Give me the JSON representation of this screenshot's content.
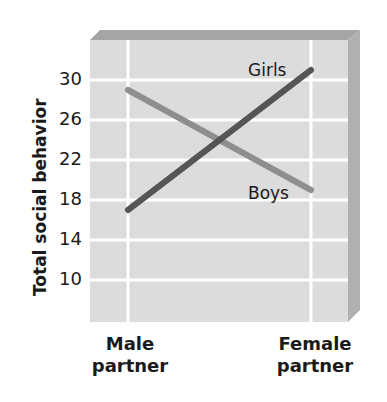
{
  "chart_data": {
    "type": "line",
    "title": "",
    "xlabel": "",
    "ylabel": "Total social behavior",
    "categories": [
      "Male partner",
      "Female partner"
    ],
    "x_tick_lines": [
      [
        "Male",
        "partner"
      ],
      [
        "Female",
        "partner"
      ]
    ],
    "y_ticks": [
      10,
      14,
      18,
      22,
      26,
      30
    ],
    "y_tick_labels": [
      "10",
      "14",
      "18",
      "22",
      "26",
      "30"
    ],
    "ylim": [
      6,
      34
    ],
    "grid": true,
    "legend": "inline labels",
    "series": [
      {
        "name": "Girls",
        "values": [
          17,
          31
        ],
        "color": "#555555"
      },
      {
        "name": "Boys",
        "values": [
          29,
          19
        ],
        "color": "#8e8e8e"
      }
    ]
  },
  "colors": {
    "plot_bg": "#dcdcdc",
    "plot_shadow": "#a8a8a8",
    "gridline": "#ffffff",
    "text": "#1a1a1a"
  }
}
